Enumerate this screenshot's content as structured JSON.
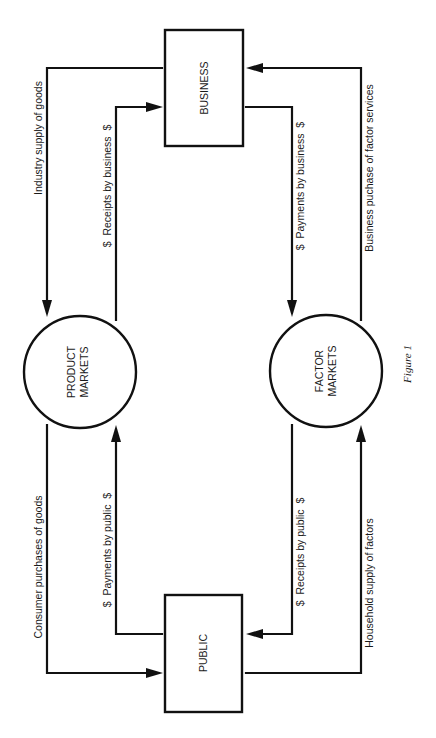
{
  "nodes": {
    "business": {
      "label": "BUSINESS"
    },
    "public": {
      "label": "PUBLIC"
    },
    "product_markets": {
      "line1": "PRODUCT",
      "line2": "MARKETS"
    },
    "factor_markets": {
      "line1": "FACTOR",
      "line2": "MARKETS"
    }
  },
  "flows": {
    "industry_supply": "Industry supply of goods",
    "receipts_by_business": "$  Receipts by business  $",
    "payments_by_business": "$  Payments by business  $",
    "business_purchase": "Business puchase of factor services",
    "consumer_purchases": "Consumer purchases of goods",
    "payments_by_public": "$  Payments by public  $",
    "receipts_by_public": "$  Receipts by public  $",
    "household_supply": "Household supply of factors"
  },
  "caption": "Figure 1",
  "colors": {
    "ink": "#111111",
    "background": "#ffffff"
  }
}
